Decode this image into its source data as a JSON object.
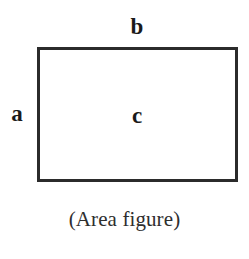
{
  "figure": {
    "caption": "(Area figure)",
    "shape": {
      "type": "rectangle",
      "stroke_color": "#2b2b2b",
      "fill_color": "#ffffff",
      "stroke_width_px": 3,
      "x_px": 37,
      "y_px": 47,
      "width_px": 201,
      "height_px": 135
    },
    "labels": {
      "top_side": "b",
      "left_side": "a",
      "interior": "c"
    },
    "background_color": "#ffffff",
    "text_color": "#1a1a1a"
  }
}
